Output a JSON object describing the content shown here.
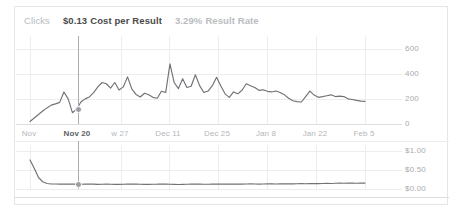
{
  "metrics": [
    {
      "value": "",
      "label": "Clicks",
      "style": "plain"
    },
    {
      "value": "$0.13",
      "label": "Cost per Result",
      "style": "strong"
    },
    {
      "value": "3.29%",
      "label": "Result Rate",
      "style": "muted"
    }
  ],
  "main_chart": {
    "y_labels": [
      "600",
      "400",
      "200",
      "0"
    ],
    "x_labels": [
      "Nov",
      "Nov 20",
      "w 27",
      "Dec 11",
      "Dec 25",
      "Jan 8",
      "Jan 22",
      "Feb 5"
    ],
    "selected_x_label": "Nov 20"
  },
  "mini_chart": {
    "y_labels": [
      "$1.00",
      "$0.50",
      "$0.00"
    ]
  },
  "chart_data": [
    {
      "type": "line",
      "title": "Clicks",
      "xlabel": "",
      "ylabel": "Clicks",
      "ylim": [
        0,
        700
      ],
      "grid": true,
      "legend": "none",
      "x_tick_labels": [
        "Nov",
        "Nov 20",
        "w 27",
        "Dec 11",
        "Dec 25",
        "Jan 8",
        "Jan 22",
        "Feb 5"
      ],
      "y_tick_values": [
        0,
        200,
        400,
        600
      ],
      "y_tick_labels": [
        "0",
        "200",
        "400",
        "600"
      ],
      "cursor_x_label": "Nov 20",
      "cursor_y_value": 160,
      "x": [
        0,
        1,
        2,
        3,
        4,
        5,
        6,
        7,
        8,
        9,
        10,
        11,
        12,
        13,
        14,
        15,
        16,
        17,
        18,
        19,
        20,
        21,
        22,
        23,
        24,
        25,
        26,
        27,
        28,
        29,
        30,
        31,
        32,
        33,
        34,
        35,
        36,
        37,
        38,
        39,
        40,
        41,
        42,
        43,
        44,
        45,
        46,
        47,
        48,
        49,
        50,
        51,
        52,
        53,
        54,
        55,
        56,
        57,
        58,
        59,
        60,
        61,
        62,
        63,
        64,
        65,
        66,
        67,
        68,
        69,
        70,
        71,
        72,
        73,
        74,
        75,
        76,
        77,
        78,
        79
      ],
      "values": [
        20,
        48,
        75,
        103,
        128,
        150,
        160,
        172,
        255,
        200,
        90,
        118,
        175,
        200,
        215,
        250,
        295,
        330,
        320,
        285,
        330,
        270,
        295,
        375,
        280,
        235,
        215,
        245,
        232,
        212,
        205,
        260,
        250,
        478,
        330,
        282,
        360,
        290,
        300,
        392,
        305,
        250,
        262,
        305,
        372,
        302,
        240,
        212,
        255,
        240,
        268,
        320,
        305,
        290,
        268,
        272,
        260,
        255,
        262,
        250,
        232,
        205,
        185,
        178,
        175,
        218,
        262,
        230,
        212,
        218,
        225,
        232,
        218,
        222,
        218,
        200,
        195,
        188,
        182,
        180
      ]
    },
    {
      "type": "line",
      "title": "Cost per Result",
      "xlabel": "",
      "ylabel": "Cost per Result",
      "ylim": [
        0.0,
        1.15
      ],
      "grid": true,
      "legend": "none",
      "y_tick_values": [
        0.0,
        0.5,
        1.0
      ],
      "y_tick_labels": [
        "$0.00",
        "$0.50",
        "$1.00"
      ],
      "cursor_x_label": "Nov 20",
      "cursor_y_value": 0.13,
      "x": [
        0,
        1,
        2,
        3,
        4,
        5,
        6,
        7,
        8,
        9,
        10,
        11,
        12,
        13,
        14,
        15,
        16,
        17,
        18,
        19,
        20,
        21,
        22,
        23,
        24,
        25,
        26,
        27,
        28,
        29,
        30,
        31,
        32,
        33,
        34,
        35,
        36,
        37,
        38,
        39,
        40,
        41,
        42,
        43,
        44,
        45,
        46,
        47,
        48,
        49,
        50,
        51,
        52,
        53,
        54,
        55,
        56,
        57,
        58,
        59,
        60,
        61,
        62,
        63,
        64,
        65,
        66,
        67,
        68,
        69,
        70,
        71,
        72,
        73,
        74,
        75,
        76,
        77,
        78,
        79
      ],
      "values": [
        0.76,
        0.54,
        0.3,
        0.19,
        0.145,
        0.132,
        0.13,
        0.128,
        0.127,
        0.128,
        0.131,
        0.127,
        0.124,
        0.126,
        0.129,
        0.126,
        0.122,
        0.124,
        0.127,
        0.124,
        0.12,
        0.122,
        0.124,
        0.127,
        0.13,
        0.127,
        0.124,
        0.121,
        0.12,
        0.123,
        0.126,
        0.132,
        0.129,
        0.124,
        0.12,
        0.118,
        0.12,
        0.124,
        0.127,
        0.13,
        0.128,
        0.125,
        0.123,
        0.126,
        0.129,
        0.131,
        0.128,
        0.126,
        0.129,
        0.131,
        0.128,
        0.13,
        0.133,
        0.131,
        0.129,
        0.132,
        0.135,
        0.133,
        0.131,
        0.134,
        0.137,
        0.135,
        0.133,
        0.136,
        0.139,
        0.137,
        0.14,
        0.143,
        0.141,
        0.144,
        0.147,
        0.145,
        0.149,
        0.152,
        0.15,
        0.154,
        0.152,
        0.15,
        0.152,
        0.155
      ]
    }
  ],
  "colors": {
    "line": "#6f7276",
    "grid": "#ededed",
    "text_strong": "#4a4a4a",
    "text_muted": "#b4b7bb",
    "card_border": "#e6e6e6"
  }
}
